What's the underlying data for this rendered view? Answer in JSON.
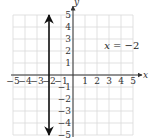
{
  "chart_data": {
    "type": "line",
    "title": "",
    "xlabel": "x",
    "ylabel": "y",
    "xlim": [
      -5,
      5
    ],
    "ylim": [
      -5,
      5
    ],
    "grid": true,
    "x_ticks": [
      -5,
      -4,
      -3,
      -2,
      -1,
      1,
      2,
      3,
      4,
      5
    ],
    "y_ticks": [
      5,
      4,
      3,
      2,
      1,
      -1,
      -2,
      -3,
      -4,
      -5
    ],
    "x_tick_labels": [
      "−5",
      "−4",
      "−3",
      "−2",
      "−1",
      "1",
      "2",
      "3",
      "4",
      "5"
    ],
    "y_tick_labels": [
      "5",
      "4",
      "3",
      "2",
      "1",
      "−1",
      "−2",
      "−3",
      "−4",
      "−5"
    ],
    "series": [
      {
        "name": "x = −2",
        "kind": "vertical-line",
        "x": [
          -2,
          -2
        ],
        "y": [
          -5,
          5
        ],
        "arrows": "both"
      }
    ],
    "annotations": [
      {
        "text_var": "x",
        "text_rest": " = −2",
        "x": 2.6,
        "y": 2.5
      }
    ]
  },
  "colors": {
    "grid": "#d9d9d9",
    "axis": "#333333",
    "line": "#111111"
  }
}
